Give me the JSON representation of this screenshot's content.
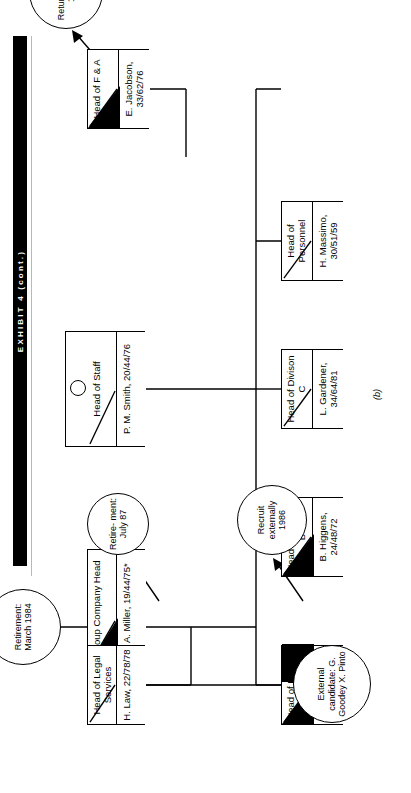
{
  "exhibit": {
    "title": "EXHIBIT 4 (cont.)"
  },
  "figure": {
    "caption": "(b)"
  },
  "nodes": [
    {
      "id": "group-company-head",
      "title": "Group Company Head",
      "name": "J. A. Miller, 19/44/75*"
    },
    {
      "id": "head-of-legal-services",
      "title": "Head of Legal Services",
      "name": "H. Law, 22/78/78"
    },
    {
      "id": "head-of-staff",
      "title": "Head of Staff",
      "name": "P. M. Smith, 20/44/76"
    },
    {
      "id": "head-of-division-a",
      "title": "Head of Division A",
      "name": "P. Hill, 28/69/80"
    },
    {
      "id": "head-of-division-b",
      "title": "Head of Division B",
      "name": "B. Higgens, 24/48/72"
    },
    {
      "id": "head-of-division-c",
      "title": "Head of Divison C",
      "name": "L. Gardener, 34/64/81"
    },
    {
      "id": "head-of-personnel",
      "title": "Head of Personnel",
      "name": "H. Massimo, 30/51/59"
    },
    {
      "id": "head-of-f-and-a",
      "title": "Head of F & A",
      "name": "E. Jacobson, 33/62/76"
    }
  ],
  "annotations": [
    {
      "id": "retirement-march-1984",
      "text": "Retirement: March 1984"
    },
    {
      "id": "external-candidate",
      "text": "External candidate: G. Goodey X. Pinto"
    },
    {
      "id": "retirement-july-87",
      "text": "Retire- ment: July 87"
    },
    {
      "id": "recruit-externally-1986",
      "text": "Recruit externally 1986"
    },
    {
      "id": "returns-to-us-1982",
      "text": "Returns to US 1982"
    }
  ],
  "colors": {
    "ink": "#000000",
    "paper": "#ffffff",
    "rule": "#b9b9b9"
  }
}
